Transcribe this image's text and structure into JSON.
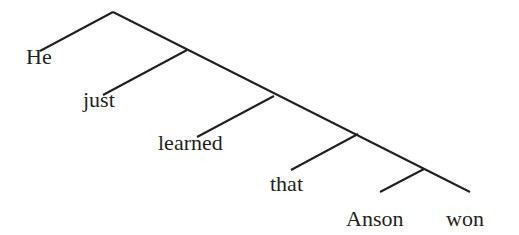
{
  "diagram": {
    "type": "syntax-tree",
    "line_color": "#231f20",
    "words": [
      {
        "text": "He",
        "x": 26,
        "y": 46
      },
      {
        "text": "just",
        "x": 83,
        "y": 89
      },
      {
        "text": "learned",
        "x": 158,
        "y": 132
      },
      {
        "text": "that",
        "x": 270,
        "y": 173
      },
      {
        "text": "Anson",
        "x": 346,
        "y": 208
      },
      {
        "text": "won",
        "x": 446,
        "y": 208
      }
    ],
    "edges": [
      [
        113,
        12,
        40,
        51
      ],
      [
        113,
        12,
        470,
        192
      ],
      [
        187,
        50,
        103,
        95
      ],
      [
        274,
        96,
        197,
        137
      ],
      [
        358,
        134,
        291,
        170
      ],
      [
        424,
        169,
        380,
        192
      ]
    ]
  }
}
